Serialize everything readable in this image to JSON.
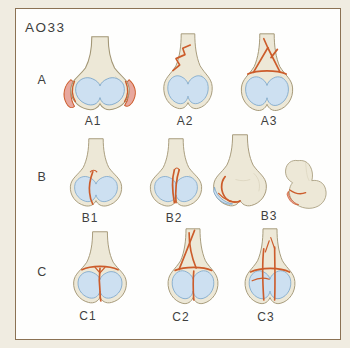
{
  "title": "AO33",
  "rows": [
    {
      "label": "A",
      "items": [
        {
          "label": "A1",
          "icon": "femur-frontal-avulsion"
        },
        {
          "label": "A2",
          "icon": "femur-frontal-simple-oblique"
        },
        {
          "label": "A3",
          "icon": "femur-frontal-multifragmentary"
        }
      ]
    },
    {
      "label": "B",
      "items": [
        {
          "label": "B1",
          "icon": "femur-frontal-sagittal-condyle"
        },
        {
          "label": "B2",
          "icon": "femur-frontal-sagittal-central"
        },
        {
          "label": "B3",
          "icon": "femur-frontal-coronal"
        },
        {
          "label": "",
          "icon": "femur-lateral-coronal"
        }
      ]
    },
    {
      "label": "C",
      "items": [
        {
          "label": "C1",
          "icon": "femur-frontal-t-shaped"
        },
        {
          "label": "C2",
          "icon": "femur-frontal-t-shaft-wedge"
        },
        {
          "label": "C3",
          "icon": "femur-frontal-complete-multifragmentary"
        }
      ]
    }
  ],
  "colors": {
    "canvas_bg": "#f0ece1",
    "panel_bg": "#fefefd",
    "frame_border": "#8b7254",
    "text": "#3e3e3e",
    "bone_fill": "#ede8d7",
    "bone_line": "#a39776",
    "bone_shade": "#d9d2bc",
    "cart_fill": "#cde0f1",
    "cart_line": "#77a3c9",
    "fracture": "#cc5c2b",
    "fragment": "#e8a89e"
  }
}
